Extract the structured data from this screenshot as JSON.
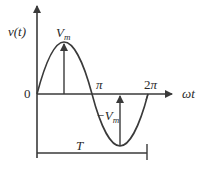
{
  "diagram": {
    "y_axis_label": "v(t)",
    "x_axis_label": "ωt",
    "origin_label": "0",
    "peak_label": "V",
    "peak_sub": "m",
    "trough_label": "−V",
    "trough_sub": "m",
    "tick_pi": "π",
    "tick_2pi": "2π",
    "period_label": "T",
    "colors": {
      "stroke": "#3a3a3a",
      "background": "#ffffff"
    }
  }
}
